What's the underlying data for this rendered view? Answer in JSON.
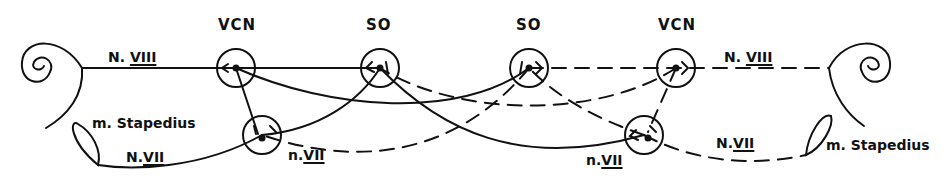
{
  "diagram": {
    "nodes": {
      "vcn_left": "VCN",
      "so_left": "SO",
      "so_right": "SO",
      "vcn_right": "VCN"
    },
    "labels": {
      "nerve_viii_left_prefix": "N. ",
      "nerve_viii_left_num": "VIII",
      "nerve_viii_right_prefix": "N. ",
      "nerve_viii_right_num": "VIII",
      "nerve_vii_left_prefix": "N.",
      "nerve_vii_left_num": "VII",
      "nerve_vii_right_prefix": "N.",
      "nerve_vii_right_num": "VII",
      "nucleus_vii_left_prefix": "n.",
      "nucleus_vii_left_num": "VII",
      "nucleus_vii_right_prefix": "n.",
      "nucleus_vii_right_num": "VII",
      "muscle_left": "m. Stapedius",
      "muscle_right": "m. Stapedius"
    },
    "legend": {
      "solid_line": "ipsilateral/left-side pathway",
      "dashed_line": "right-side pathway"
    },
    "colors": {
      "ink": "#111111",
      "background": "#ffffff"
    }
  }
}
